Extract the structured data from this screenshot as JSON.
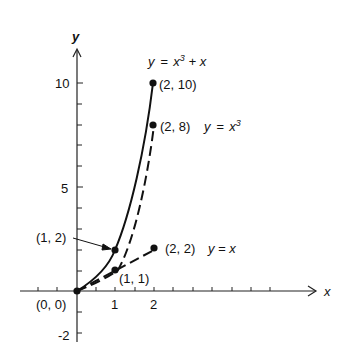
{
  "axes": {
    "x_label": "x",
    "y_label": "y",
    "x_ticks": [
      "1",
      "2"
    ],
    "y_ticks": [
      "10",
      "5",
      "-2"
    ],
    "origin_label": "(0, 0)"
  },
  "curves": [
    {
      "name": "y = x³ + x",
      "style": "solid",
      "points": [
        [
          0,
          0
        ],
        [
          1,
          2
        ],
        [
          2,
          10
        ]
      ]
    },
    {
      "name": "y = x³",
      "style": "dashed",
      "points": [
        [
          0,
          0
        ],
        [
          1,
          1
        ],
        [
          2,
          8
        ]
      ]
    },
    {
      "name": "y = x",
      "style": "dashed",
      "points": [
        [
          0,
          0
        ],
        [
          1,
          1
        ],
        [
          2,
          2
        ]
      ]
    }
  ],
  "labels": {
    "cubic_plus_x": {
      "y": "y",
      "eq": "=",
      "x": "x",
      "sup": "3",
      "plus": "+ x"
    },
    "p_2_10": "(2, 10)",
    "p_2_8": "(2, 8)",
    "cubic": {
      "y": "y",
      "eq": "=",
      "x": "x",
      "sup": "3"
    },
    "p_1_2": "(1, 2)",
    "p_2_2": "(2, 2)",
    "linear": "y = x",
    "p_1_1": "(1, 1)"
  }
}
